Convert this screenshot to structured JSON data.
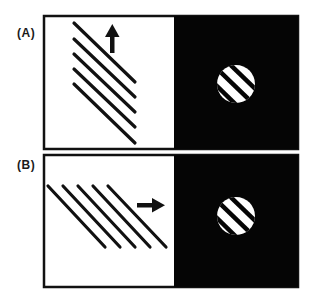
{
  "figure": {
    "panels": [
      {
        "label": "(A)",
        "description": "Grating moving upward behind a circular aperture",
        "arrow_direction": "up",
        "line_count": 5
      },
      {
        "label": "(B)",
        "description": "Grating moving rightward behind a circular aperture",
        "arrow_direction": "right",
        "line_count": 5
      }
    ],
    "colors": {
      "foreground": "#111111",
      "background": "#ffffff",
      "aperture_field": "#050505"
    }
  }
}
